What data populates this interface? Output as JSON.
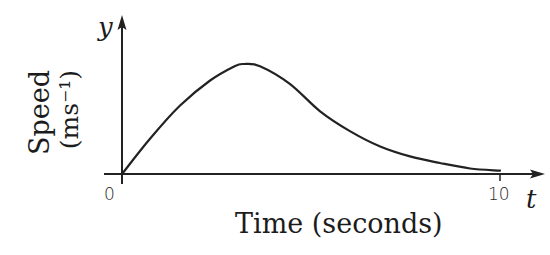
{
  "chart_data": {
    "type": "line",
    "title": "",
    "xlabel": "Time (seconds)",
    "ylabel": "Speed (ms⁻¹)",
    "ylabel_lines": [
      "Speed",
      "(ms⁻¹)"
    ],
    "x_axis_variable": "t",
    "y_axis_variable": "y",
    "x_ticks": [
      0,
      10
    ],
    "x_tick_labels": [
      "0",
      "10"
    ],
    "y_ticks": [],
    "xlim": [
      0,
      10
    ],
    "ylim_note": "no numeric y scale shown; y values given relative to peak (peak = 1.0)",
    "grid": false,
    "legend": null,
    "series": [
      {
        "name": "speed",
        "x": [
          0,
          0.74,
          1.53,
          2.33,
          2.98,
          3.23,
          3.65,
          4.44,
          5.24,
          6.03,
          6.83,
          7.62,
          8.41,
          9.21,
          10
        ],
        "y": [
          0,
          0.32,
          0.62,
          0.85,
          0.98,
          1.0,
          0.98,
          0.82,
          0.57,
          0.39,
          0.25,
          0.16,
          0.1,
          0.05,
          0.03
        ]
      }
    ],
    "peak": {
      "t": 3.2,
      "y_relative": 1.0
    },
    "colors": {
      "line": "#222222",
      "axis": "#222222",
      "background": "#ffffff"
    }
  },
  "labels": {
    "y_var": "y",
    "t_var": "t",
    "origin": "0",
    "ten": "10",
    "ylabel_line1": "Speed",
    "ylabel_line2": "(ms⁻¹)",
    "xlabel": "Time (seconds)"
  }
}
